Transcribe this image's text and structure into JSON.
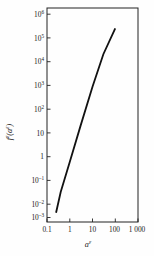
{
  "chart_data": {
    "type": "line",
    "title": "",
    "subtitle": "",
    "xlabel": "a^ε",
    "ylabel": "f^ε(a^ε)",
    "xscale": "log",
    "yscale": "log",
    "xlim": [
      0.1,
      1000
    ],
    "ylim": [
      0.0001,
      10000000
    ],
    "grid": false,
    "legend": null,
    "xticks": [
      0.1,
      1,
      10,
      100,
      1000
    ],
    "xticklabels": [
      "0.1",
      "1",
      "10",
      "100",
      "1 000"
    ],
    "yticks": [
      0.001,
      0.01,
      0.1,
      1,
      10,
      100,
      1000,
      10000,
      100000,
      1000000
    ],
    "yticklabels": [
      "10⁻³",
      "10⁻²",
      "10⁻¹",
      "1",
      "10",
      "10²",
      "10³",
      "10⁴",
      "10⁵",
      "10⁶"
    ],
    "series": [
      {
        "name": "fᵉ(aᵉ)",
        "x": [
          0.25,
          0.4,
          1,
          3,
          10,
          30,
          100,
          400
        ],
        "y": [
          0.0003,
          0.0035,
          0.12,
          9,
          900,
          42000,
          900000,
          30000000
        ]
      }
    ],
    "annotations": []
  },
  "axes": {
    "x_tick_labels": [
      {
        "label": "0.1",
        "value": 0.1
      },
      {
        "label": "1",
        "value": 1
      },
      {
        "label": "10",
        "value": 10
      },
      {
        "label": "100",
        "value": 100
      },
      {
        "label": "1 000",
        "value": 1000
      }
    ],
    "y_tick_labels": [
      {
        "mantissa": "10",
        "exponent": "6",
        "value": 1000000
      },
      {
        "mantissa": "10",
        "exponent": "5",
        "value": 100000
      },
      {
        "mantissa": "10",
        "exponent": "4",
        "value": 10000
      },
      {
        "mantissa": "10",
        "exponent": "3",
        "value": 1000
      },
      {
        "mantissa": "10",
        "exponent": "2",
        "value": 100
      },
      {
        "mantissa": "10",
        "exponent": "",
        "value": 10
      },
      {
        "mantissa": "1",
        "exponent": "",
        "value": 1
      },
      {
        "mantissa": "10",
        "exponent": "–1",
        "value": 0.1
      },
      {
        "mantissa": "10",
        "exponent": "–2",
        "value": 0.01
      },
      {
        "mantissa": "10",
        "exponent": "–3",
        "value": 0.001
      }
    ],
    "x_axis_title_base": "a",
    "x_axis_title_sup": "ε",
    "y_axis_title_base_1": "f",
    "y_axis_title_sup_1": "ε",
    "y_axis_title_base_2": "(a",
    "y_axis_title_sup_2": "ε",
    "y_axis_title_base_3": ")"
  },
  "colors": {
    "line": "#111111",
    "frame": "#222222",
    "background": "#fefefe",
    "text": "#1a1a1a"
  }
}
